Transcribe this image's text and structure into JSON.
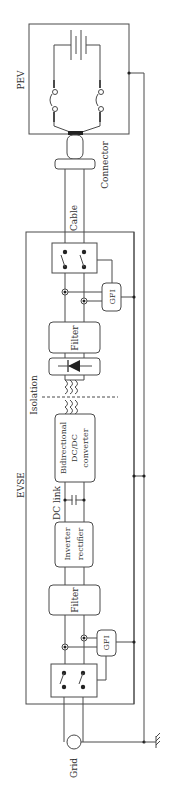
{
  "diagram": {
    "type": "block-diagram",
    "orientation": "rotated-90",
    "colors": {
      "line": "#4a4a4a",
      "text": "#333333",
      "background": "#ffffff"
    },
    "labels": {
      "pev": "PEV",
      "connector": "Connector",
      "cable": "Cable",
      "evse": "EVSE",
      "isolation": "Isolation",
      "dc_link": "DC link",
      "grid": "Grid"
    },
    "blocks": {
      "gfi_top": "GFI",
      "filter_top": "Filter",
      "bidirectional_1": "Bidirectional",
      "bidirectional_2": "DC/DC",
      "bidirectional_3": "converter",
      "inverter_1": "Inverter",
      "inverter_2": "rectifier",
      "filter_bottom": "Filter",
      "gfi_bottom": "GFI"
    }
  }
}
